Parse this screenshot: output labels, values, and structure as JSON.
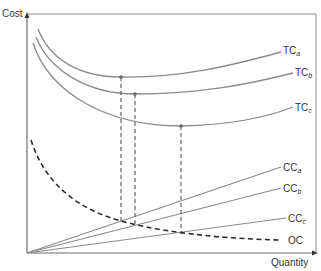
{
  "axes": {
    "y_label": "Cost",
    "x_label": "Quantity"
  },
  "curves": {
    "tc": [
      {
        "name": "TC",
        "sub": "a"
      },
      {
        "name": "TC",
        "sub": "b"
      },
      {
        "name": "TC",
        "sub": "c"
      }
    ],
    "cc": [
      {
        "name": "CC",
        "sub": "a"
      },
      {
        "name": "CC",
        "sub": "b"
      },
      {
        "name": "CC",
        "sub": "c"
      }
    ],
    "oc": {
      "name": "OC"
    }
  },
  "colors": {
    "curve": "#8a8a8a",
    "axis": "#6e6e6e",
    "dashed": "#2a2a2a",
    "text": "#333333"
  }
}
